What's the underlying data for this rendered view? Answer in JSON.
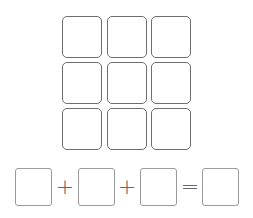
{
  "grid": {
    "rows": 3,
    "cols": 3,
    "cells": [
      "",
      "",
      "",
      "",
      "",
      "",
      "",
      "",
      ""
    ]
  },
  "equation": {
    "boxes": [
      "",
      "",
      "",
      ""
    ],
    "operators": [
      "+",
      "+",
      "="
    ]
  },
  "colors": {
    "grid_border": "#6e6e6e",
    "equation_border": "#9a9a9a",
    "background": "#ffffff"
  }
}
